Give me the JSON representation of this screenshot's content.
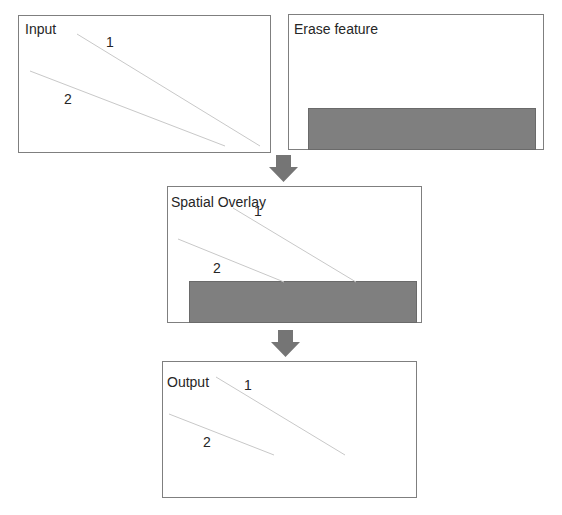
{
  "panels": {
    "input": {
      "title": "Input",
      "labels": [
        "1",
        "2"
      ]
    },
    "erase": {
      "title": "Erase feature"
    },
    "overlay": {
      "title": "Spatial Overlay",
      "labels": [
        "1",
        "2"
      ]
    },
    "output": {
      "title": "Output",
      "labels": [
        "1",
        "2"
      ]
    }
  },
  "colors": {
    "border": "#7f7f7f",
    "erase_fill": "#7f7f7f",
    "line": "#c8c8c8",
    "arrow": "#757575"
  }
}
